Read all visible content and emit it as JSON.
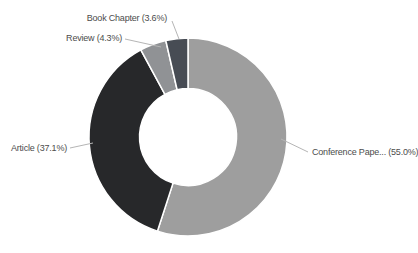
{
  "background_color": "#ffffff",
  "chart_data": {
    "type": "pie",
    "subtype": "donut",
    "title": "",
    "legend": "none",
    "direction": "clockwise",
    "start_angle_deg": 0,
    "inner_radius_ratio": 0.49,
    "label_color": "#4c4c4c",
    "leader_line_color": "#b5b5b5",
    "slices": [
      {
        "label": "Conference Pape...",
        "display": "Conference Pape... (55.0%)",
        "value": 55.0,
        "color": "#9e9e9e"
      },
      {
        "label": "Article",
        "display": "Article (37.1%)",
        "value": 37.1,
        "color": "#27282a"
      },
      {
        "label": "Review",
        "display": "Review (4.3%)",
        "value": 4.3,
        "color": "#909295"
      },
      {
        "label": "Book Chapter",
        "display": "Book Chapter (3.6%)",
        "value": 3.6,
        "color": "#474c54"
      }
    ]
  }
}
